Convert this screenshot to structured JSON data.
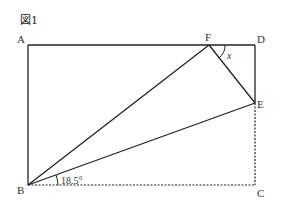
{
  "figure": {
    "label": "図1",
    "points": {
      "A": "A",
      "B": "B",
      "C": "C",
      "D": "D",
      "E": "E",
      "F": "F"
    },
    "angles": {
      "x_label": "x",
      "given_angle": "18.5°"
    },
    "colors": {
      "line": "#222222",
      "background": "#ffffff"
    }
  }
}
